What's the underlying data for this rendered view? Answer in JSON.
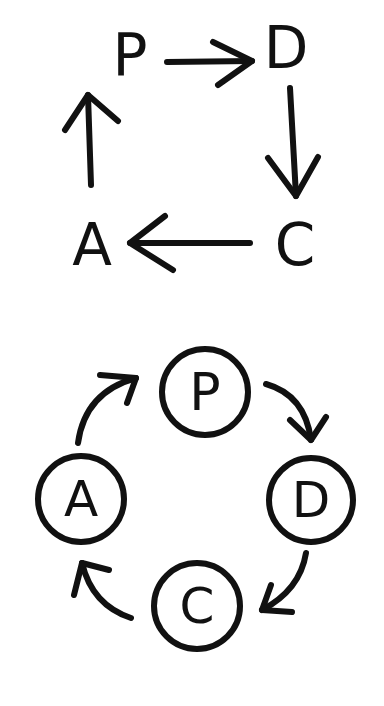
{
  "diagram": {
    "square_cycle": {
      "nodes": [
        {
          "id": "P",
          "label": "P"
        },
        {
          "id": "D",
          "label": "D"
        },
        {
          "id": "C",
          "label": "C"
        },
        {
          "id": "A",
          "label": "A"
        }
      ],
      "edges": [
        {
          "from": "P",
          "to": "D"
        },
        {
          "from": "D",
          "to": "C"
        },
        {
          "from": "C",
          "to": "A"
        },
        {
          "from": "A",
          "to": "P"
        }
      ]
    },
    "circle_cycle": {
      "nodes": [
        {
          "id": "P",
          "label": "P"
        },
        {
          "id": "D",
          "label": "D"
        },
        {
          "id": "C",
          "label": "C"
        },
        {
          "id": "A",
          "label": "A"
        }
      ],
      "edges": [
        {
          "from": "P",
          "to": "D"
        },
        {
          "from": "D",
          "to": "C"
        },
        {
          "from": "C",
          "to": "A"
        },
        {
          "from": "A",
          "to": "P"
        }
      ]
    },
    "colors": {
      "ink": "#111111",
      "background": "#ffffff"
    }
  }
}
